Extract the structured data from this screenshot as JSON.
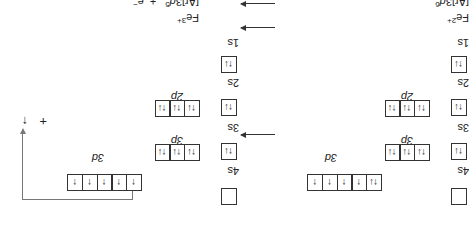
{
  "orientation": "rotated-180",
  "equation": {
    "reactant": {
      "symbol": "Fe",
      "charge": "2+",
      "config_base": "[Ar]3",
      "config_orbital": "d",
      "config_count": "6"
    },
    "product": {
      "symbol": "Fe",
      "charge": "3+",
      "config_base": "[Ar]3",
      "config_orbital": "d",
      "config_count": "5"
    },
    "plus": "+",
    "electron": "e",
    "electron_charge": "−"
  },
  "diagrams": [
    {
      "ion": "Fe2+",
      "subshells": [
        {
          "label": "1s",
          "boxes": [
            "↑↓"
          ]
        },
        {
          "label": "2s",
          "boxes": [
            "↑↓"
          ]
        },
        {
          "label": "2p",
          "boxes": [
            "↑↓",
            "↑↓",
            "↑↓"
          ]
        },
        {
          "label": "3s",
          "boxes": [
            "↑↓"
          ]
        },
        {
          "label": "3p",
          "boxes": [
            "↑↓",
            "↑↓",
            "↑↓"
          ]
        },
        {
          "label": "4s",
          "boxes": [
            ""
          ]
        },
        {
          "label": "3d",
          "boxes": [
            "↑↓",
            "↑",
            "↑",
            "↑",
            "↑"
          ]
        }
      ]
    },
    {
      "ion": "Fe3+",
      "subshells": [
        {
          "label": "1s",
          "boxes": [
            "↑↓"
          ]
        },
        {
          "label": "2s",
          "boxes": [
            "↑↓"
          ]
        },
        {
          "label": "2p",
          "boxes": [
            "↑↓",
            "↑↓",
            "↑↓"
          ]
        },
        {
          "label": "3s",
          "boxes": [
            "↑↓"
          ]
        },
        {
          "label": "3p",
          "boxes": [
            "↑↓",
            "↑↓",
            "↑↓"
          ]
        },
        {
          "label": "4s",
          "boxes": [
            ""
          ]
        },
        {
          "label": "3d",
          "boxes": [
            "↑",
            "↑",
            "↑",
            "↑",
            "↑"
          ]
        }
      ],
      "released": {
        "plus": "+",
        "electron_arrow": "↑"
      }
    }
  ],
  "reaction_arrows": 3
}
